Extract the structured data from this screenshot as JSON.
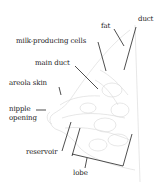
{
  "diagram": {
    "type": "anatomical breast cross-section",
    "labels": {
      "fat": "fat",
      "duct": "duct",
      "milk_producing_cells": "milk-producing cells",
      "main_duct": "main duct",
      "areola_skin": "areola skin",
      "nipple_line1": "nipple",
      "nipple_line2": "opening",
      "reservoir": "reservoir",
      "lobe": "lobe"
    },
    "colors": {
      "text": "#222222",
      "leader_lines": "#222222",
      "illustration": "#d8d8d8"
    }
  }
}
